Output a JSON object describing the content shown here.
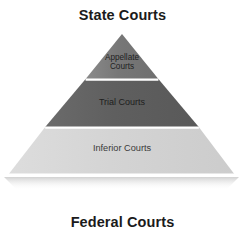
{
  "figure": {
    "top_title": "State Courts",
    "bottom_title": "Federal Courts",
    "background_color": "#ffffff",
    "title_color": "#1b1b1b"
  },
  "pyramid": {
    "apex": {
      "x": 122,
      "y": 34
    },
    "base_left": {
      "x": 8,
      "y": 175
    },
    "base_right": {
      "x": 235,
      "y": 175
    },
    "divider_color": "#ffffff",
    "bands": [
      {
        "label": "Appellate\nCourts",
        "name": "appellate-courts",
        "color": "#787878",
        "top_y": 34,
        "bottom_y": 79,
        "text_color": "#1f1f1f"
      },
      {
        "label": "Trial Courts",
        "name": "trial-courts",
        "color": "#5f5f5f",
        "top_y": 79,
        "bottom_y": 127,
        "text_color": "#1d1d1d"
      },
      {
        "label": "Inferior Courts",
        "name": "inferior-courts",
        "color": "#d3d3d3",
        "top_y": 127,
        "bottom_y": 175,
        "text_color": "#3a3a3a"
      }
    ]
  }
}
